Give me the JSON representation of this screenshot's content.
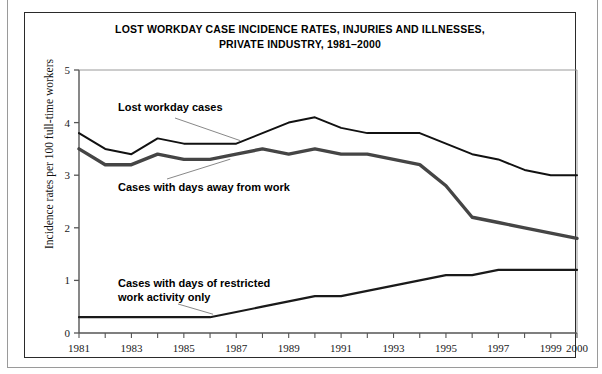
{
  "figure": {
    "title_line1": "LOST WORKDAY CASE INCIDENCE RATES, INJURIES AND ILLNESSES,",
    "title_line2": "PRIVATE INDUSTRY, 1981–2000",
    "y_axis_title": "Incidence rates per 100 full-time workers"
  },
  "annotations": {
    "lost_workday_cases": "Lost workday cases",
    "cases_days_away": "Cases with days away from work",
    "cases_restricted": "Cases with days of restricted\nwork activity only"
  },
  "axis": {
    "y_ticks": [
      "0",
      "1",
      "2",
      "3",
      "4",
      "5"
    ],
    "x_ticks_labeled": [
      "1981",
      "1983",
      "1985",
      "1987",
      "1989",
      "1991",
      "1993",
      "1995",
      "1997",
      "1999",
      "2000"
    ]
  },
  "colors": {
    "line_lost_workday": "#111111",
    "line_days_away": "#454545",
    "line_restricted": "#1a1a1a",
    "axis": "#555555",
    "frame": "#2a2a2a",
    "outer_frame": "#9a9a9a",
    "background": "#ffffff"
  },
  "chart_data": {
    "type": "line",
    "xlabel": "",
    "ylabel": "Incidence rates per 100 full-time workers",
    "xlim": [
      1981,
      2000
    ],
    "ylim": [
      0,
      5
    ],
    "grid": false,
    "legend": "inline-annotations",
    "x": [
      1981,
      1982,
      1983,
      1984,
      1985,
      1986,
      1987,
      1988,
      1989,
      1990,
      1991,
      1992,
      1993,
      1994,
      1995,
      1996,
      1997,
      1998,
      1999,
      2000
    ],
    "series": [
      {
        "name": "Lost workday cases",
        "values": [
          3.8,
          3.5,
          3.4,
          3.7,
          3.6,
          3.6,
          3.6,
          3.8,
          4.0,
          4.1,
          3.9,
          3.8,
          3.8,
          3.8,
          3.6,
          3.4,
          3.3,
          3.1,
          3.0,
          3.0
        ]
      },
      {
        "name": "Cases with days away from work",
        "values": [
          3.5,
          3.2,
          3.2,
          3.4,
          3.3,
          3.3,
          3.4,
          3.5,
          3.4,
          3.5,
          3.4,
          3.4,
          3.3,
          3.2,
          2.8,
          2.2,
          2.1,
          2.0,
          1.9,
          1.8
        ]
      },
      {
        "name": "Cases with days of restricted work activity only",
        "values": [
          0.3,
          0.3,
          0.3,
          0.3,
          0.3,
          0.3,
          0.4,
          0.5,
          0.6,
          0.7,
          0.7,
          0.8,
          0.9,
          1.0,
          1.1,
          1.1,
          1.2,
          1.2,
          1.2,
          1.2
        ]
      }
    ]
  }
}
